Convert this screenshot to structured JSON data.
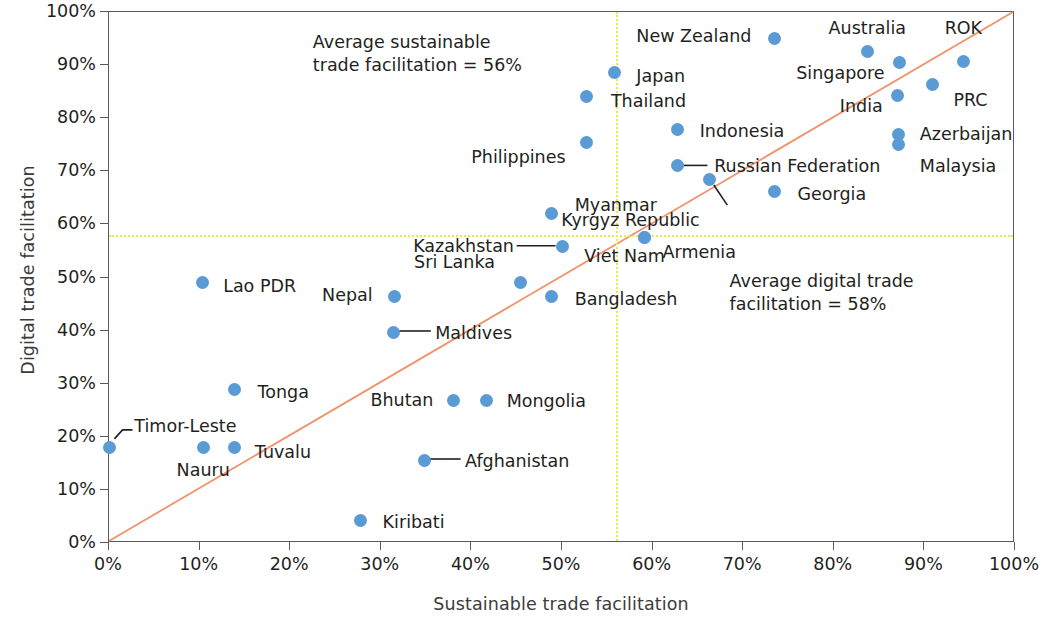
{
  "chart_data": {
    "type": "scatter",
    "title": "",
    "xlabel": "Sustainable trade facilitation",
    "ylabel": "Digital trade facilitation",
    "xlim": [
      0,
      100
    ],
    "ylim": [
      0,
      100
    ],
    "xtick_labels": [
      "0%",
      "10%",
      "20%",
      "30%",
      "40%",
      "50%",
      "60%",
      "70%",
      "80%",
      "90%",
      "100%"
    ],
    "xtick_values": [
      0,
      10,
      20,
      30,
      40,
      50,
      60,
      70,
      80,
      90,
      100
    ],
    "ytick_labels": [
      "0%",
      "10%",
      "20%",
      "30%",
      "40%",
      "50%",
      "60%",
      "70%",
      "80%",
      "90%",
      "100%"
    ],
    "ytick_values": [
      0,
      10,
      20,
      30,
      40,
      50,
      60,
      70,
      80,
      90,
      100
    ],
    "grid": false,
    "legend": "none",
    "point_color": "#5b9bd5",
    "diagonal_line_color": "#f0936a",
    "average_line_color": "#e9e93f",
    "average_sustainable": 56,
    "average_digital": 58,
    "annotations": [
      {
        "id": "avg-sustainable-note",
        "text": "Average sustainable\ntrade facilitation = 56%",
        "x": 22.5,
        "y": 96.5
      },
      {
        "id": "avg-digital-note",
        "text": "Average digital trade\nfacilitation = 58%",
        "x": 68.5,
        "y": 51.5
      }
    ],
    "points": [
      {
        "name": "Timor-Leste",
        "x": 0.0,
        "y": 18.0,
        "label_x": 2.8,
        "label_y": 21.8,
        "anchor": "r",
        "leader": [
          [
            0.6,
            19.3
          ],
          [
            1.5,
            21.0
          ],
          [
            2.6,
            21.0
          ]
        ]
      },
      {
        "name": "Nauru",
        "x": 10.4,
        "y": 18.0,
        "label_x": 10.4,
        "label_y": 13.5,
        "anchor": "c",
        "leader": null
      },
      {
        "name": "Tuvalu",
        "x": 13.9,
        "y": 18.0,
        "label_x": 16.1,
        "label_y": 17.0,
        "anchor": "r",
        "leader": null
      },
      {
        "name": "Lao PDR",
        "x": 10.3,
        "y": 49.0,
        "label_x": 12.6,
        "label_y": 48.3,
        "anchor": "r",
        "leader": null
      },
      {
        "name": "Tonga",
        "x": 13.9,
        "y": 28.9,
        "label_x": 16.4,
        "label_y": 28.3,
        "anchor": "r",
        "leader": null
      },
      {
        "name": "Kiribati",
        "x": 27.8,
        "y": 4.3,
        "label_x": 30.2,
        "label_y": 3.8,
        "anchor": "r",
        "leader": null
      },
      {
        "name": "Nepal",
        "x": 31.5,
        "y": 46.5,
        "label_x": 29.1,
        "label_y": 46.5,
        "anchor": "l",
        "leader": null
      },
      {
        "name": "Maldives",
        "x": 31.4,
        "y": 39.7,
        "label_x": 36.0,
        "label_y": 39.3,
        "anchor": "r",
        "leader": [
          [
            32.1,
            39.7
          ],
          [
            35.6,
            39.7
          ]
        ]
      },
      {
        "name": "Bhutan",
        "x": 38.0,
        "y": 26.8,
        "label_x": 35.8,
        "label_y": 26.8,
        "anchor": "l",
        "leader": null
      },
      {
        "name": "Mongolia",
        "x": 41.7,
        "y": 26.8,
        "label_x": 43.9,
        "label_y": 26.6,
        "anchor": "r",
        "leader": null
      },
      {
        "name": "Afghanistan",
        "x": 34.8,
        "y": 15.5,
        "label_x": 39.3,
        "label_y": 15.2,
        "anchor": "r",
        "leader": [
          [
            35.5,
            15.5
          ],
          [
            38.9,
            15.5
          ]
        ]
      },
      {
        "name": "Sri Lanka",
        "x": 45.4,
        "y": 49.0,
        "label_x": 42.6,
        "label_y": 52.8,
        "anchor": "l",
        "leader": null
      },
      {
        "name": "Bangladesh",
        "x": 48.8,
        "y": 46.5,
        "label_x": 51.4,
        "label_y": 45.8,
        "anchor": "r",
        "leader": null
      },
      {
        "name": "Myanmar",
        "x": 48.8,
        "y": 62.0,
        "label_x": 51.4,
        "label_y": 63.5,
        "anchor": "r",
        "leader": null
      },
      {
        "name": "Kazakhstan",
        "x": 50.1,
        "y": 55.8,
        "label_x": 44.7,
        "label_y": 55.8,
        "anchor": "l",
        "leader": [
          [
            49.4,
            55.8
          ],
          [
            45.1,
            55.8
          ]
        ]
      },
      {
        "name": "Thailand",
        "x": 52.7,
        "y": 84.0,
        "label_x": 55.4,
        "label_y": 83.0,
        "anchor": "r",
        "leader": null
      },
      {
        "name": "Philippines",
        "x": 52.7,
        "y": 75.5,
        "label_x": 50.4,
        "label_y": 72.5,
        "anchor": "l",
        "leader": null
      },
      {
        "name": "Japan",
        "x": 55.8,
        "y": 88.7,
        "label_x": 58.2,
        "label_y": 87.7,
        "anchor": "r",
        "leader": null
      },
      {
        "name": "Viet Nam",
        "x": 59.1,
        "y": 57.5,
        "label_x": 56.9,
        "label_y": 53.9,
        "anchor": "c",
        "leader": null
      },
      {
        "name": "Armenia",
        "x": 59.1,
        "y": 57.5,
        "label_x": 61.1,
        "label_y": 54.6,
        "anchor": "r",
        "leader": null
      },
      {
        "name": "Indonesia",
        "x": 62.8,
        "y": 77.8,
        "label_x": 65.2,
        "label_y": 77.4,
        "anchor": "r",
        "leader": null
      },
      {
        "name": "Russian Federation",
        "x": 62.8,
        "y": 71.0,
        "label_x": 66.8,
        "label_y": 70.8,
        "anchor": "r",
        "leader": [
          [
            63.5,
            71.0
          ],
          [
            66.2,
            71.0
          ]
        ]
      },
      {
        "name": "Kyrgyz Republic",
        "x": 66.3,
        "y": 68.5,
        "label_x": 65.2,
        "label_y": 60.6,
        "anchor": "l",
        "leader": [
          [
            66.9,
            67.3
          ],
          [
            68.4,
            63.5
          ]
        ]
      },
      {
        "name": "Georgia",
        "x": 73.5,
        "y": 66.2,
        "label_x": 76.0,
        "label_y": 65.6,
        "anchor": "r",
        "leader": null
      },
      {
        "name": "New Zealand",
        "x": 73.4,
        "y": 95.0,
        "label_x": 70.9,
        "label_y": 95.3,
        "anchor": "l",
        "leader": null
      },
      {
        "name": "Australia",
        "x": 83.7,
        "y": 92.5,
        "label_x": 83.7,
        "label_y": 96.8,
        "anchor": "c",
        "leader": null
      },
      {
        "name": "Singapore",
        "x": 87.3,
        "y": 90.5,
        "label_x": 85.6,
        "label_y": 88.3,
        "anchor": "l",
        "leader": null
      },
      {
        "name": "ROK",
        "x": 94.3,
        "y": 90.6,
        "label_x": 94.3,
        "label_y": 96.8,
        "anchor": "c",
        "leader": null
      },
      {
        "name": "India",
        "x": 87.0,
        "y": 84.2,
        "label_x": 85.4,
        "label_y": 82.2,
        "anchor": "l",
        "leader": null
      },
      {
        "name": "PRC",
        "x": 90.9,
        "y": 86.3,
        "label_x": 93.2,
        "label_y": 83.2,
        "anchor": "r",
        "leader": null
      },
      {
        "name": "Azerbaijan",
        "x": 87.1,
        "y": 77.0,
        "label_x": 89.5,
        "label_y": 76.8,
        "anchor": "r",
        "leader": null
      },
      {
        "name": "Malaysia",
        "x": 87.1,
        "y": 75.0,
        "label_x": 89.5,
        "label_y": 70.9,
        "anchor": "r",
        "leader": null
      }
    ]
  }
}
